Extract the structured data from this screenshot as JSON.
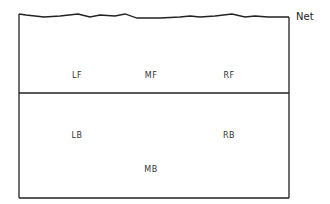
{
  "diagram": {
    "type": "volleyball-court-positions",
    "net_label": "Net",
    "front_row": [
      {
        "label": "LF",
        "x": 77,
        "y": 75
      },
      {
        "label": "MF",
        "x": 151,
        "y": 75
      },
      {
        "label": "RF",
        "x": 229,
        "y": 75
      }
    ],
    "back_row": [
      {
        "label": "LB",
        "x": 77,
        "y": 135
      },
      {
        "label": "RB",
        "x": 229,
        "y": 135
      },
      {
        "label": "MB",
        "x": 151,
        "y": 169
      }
    ],
    "colors": {
      "line": "#222222",
      "text": "#333333",
      "background": "#ffffff"
    }
  }
}
